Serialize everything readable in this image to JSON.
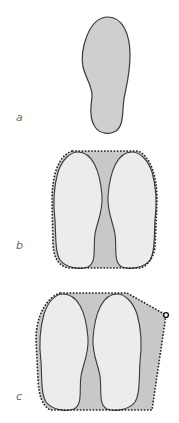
{
  "figure": {
    "panels": [
      {
        "id": "a",
        "label": "a",
        "description": "single footprint outline (sole), filled grey"
      },
      {
        "id": "b",
        "label": "b",
        "description": "two footprints side by side enclosed by a dotted convex hull; area between feet shaded"
      },
      {
        "id": "c",
        "label": "c",
        "description": "two footprints with an extra contact point at right; dotted convex hull enlarged toward the point"
      }
    ],
    "colors": {
      "foot_fill_single": "#cfcfcf",
      "foot_fill_pair": "#ececec",
      "hull_fill": "#c8c8c8",
      "outline": "#3a3a3a",
      "hull_stroke": "#222222",
      "label": "#6b6b6b"
    }
  }
}
